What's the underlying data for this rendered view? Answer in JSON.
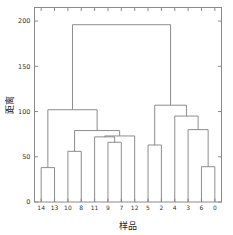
{
  "chart_data": {
    "type": "line",
    "title": "",
    "subtitle": "",
    "xlabel": "样品",
    "ylabel": "距离",
    "ylim": [
      0,
      215
    ],
    "yticks": [
      0,
      50,
      100,
      150,
      200
    ],
    "ytick_labels": [
      "0",
      "50",
      "100",
      "150",
      "200"
    ],
    "grid": false,
    "legend": null,
    "orientation": "top",
    "leaf_labels": [
      "14",
      "13",
      "10",
      "8",
      "11",
      "9",
      "7",
      "12",
      "5",
      "2",
      "4",
      "3",
      "6",
      "0"
    ],
    "line_color": "#808080",
    "merges": [
      {
        "id": "m1",
        "label": "14+13",
        "left": "14",
        "right": "13",
        "height": 38
      },
      {
        "id": "m2",
        "label": "6+0",
        "left": "6",
        "right": "0",
        "height": 39
      },
      {
        "id": "m3",
        "label": "10+8",
        "left": "10",
        "right": "8",
        "height": 56
      },
      {
        "id": "m4",
        "label": "5+2",
        "left": "5",
        "right": "2",
        "height": 63
      },
      {
        "id": "m5",
        "label": "9+7",
        "left": "9",
        "right": "7",
        "height": 66
      },
      {
        "id": "m6",
        "label": "11+(9,7)",
        "left": "11",
        "right": "m5",
        "height": 72
      },
      {
        "id": "m7",
        "label": "(11,9,7)+12",
        "left": "m6",
        "right": "12",
        "height": 73
      },
      {
        "id": "m8",
        "label": "(10,8)+(11,9,7,12)",
        "left": "m3",
        "right": "m7",
        "height": 79
      },
      {
        "id": "m9",
        "label": "3+(6,0)",
        "left": "3",
        "right": "m2",
        "height": 80
      },
      {
        "id": "m10",
        "label": "4+(3,6,0)",
        "left": "4",
        "right": "m9",
        "height": 95
      },
      {
        "id": "m11",
        "label": "(14,13)+cluster",
        "left": "m1",
        "right": "m8",
        "height": 102
      },
      {
        "id": "m12",
        "label": "(5,2)+(4,3,6,0)",
        "left": "m4",
        "right": "m10",
        "height": 107
      },
      {
        "id": "m13",
        "label": "root",
        "left": "m11",
        "right": "m12",
        "height": 196
      }
    ]
  },
  "axes": {
    "y_axis_title": "距离",
    "x_axis_title": "样品"
  }
}
